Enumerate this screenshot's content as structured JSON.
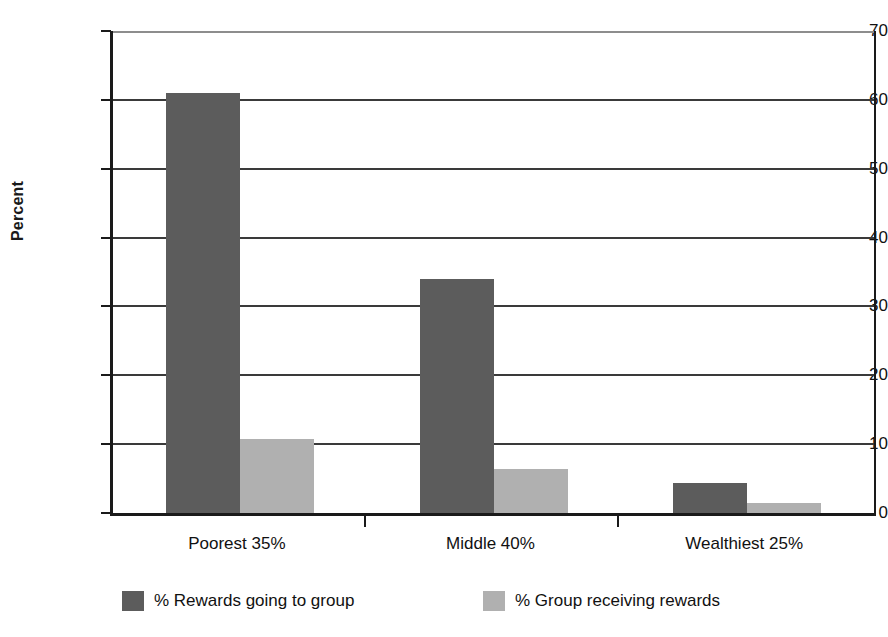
{
  "chart_data": {
    "type": "bar",
    "title": "",
    "subtitle": "",
    "xlabel": "",
    "ylabel": "Percent",
    "ylim": [
      0,
      70
    ],
    "ytick_step": 10,
    "yticks": [
      0,
      10,
      20,
      30,
      40,
      50,
      60,
      70
    ],
    "ytick_labels": [
      "0",
      "10",
      "20",
      "30",
      "40",
      "50",
      "60",
      "70"
    ],
    "grid": true,
    "grid_axis": "y",
    "legend_position": "bottom",
    "categories": [
      "Poorest 35%",
      "Middle 40%",
      "Wealthiest 25%"
    ],
    "series": [
      {
        "name": "% Rewards going to group",
        "color": "#5c5c5c",
        "values": [
          61,
          34,
          4.4
        ]
      },
      {
        "name": "% Group receiving rewards",
        "color": "#b0b0b0",
        "values": [
          10.7,
          6.4,
          1.4
        ]
      }
    ]
  },
  "colors": {
    "series_dark": "#5c5c5c",
    "series_light": "#b0b0b0",
    "axis": "#1a1a1a",
    "gridline": "#3a3a3a",
    "background": "#ffffff",
    "text": "#111111"
  }
}
